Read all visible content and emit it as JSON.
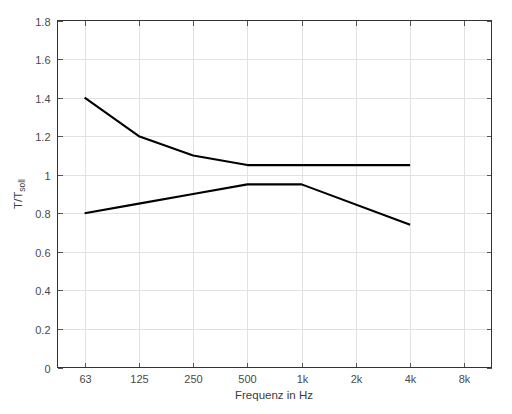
{
  "chart_data": {
    "type": "line",
    "title": "",
    "xlabel": "Frequenz in Hz",
    "ylabel": "T/T_soll",
    "ylabel_main": "T/T",
    "ylabel_subscript": "soll",
    "categories": [
      "63",
      "125",
      "250",
      "500",
      "1k",
      "2k",
      "4k",
      "8k"
    ],
    "xtick_labels": [
      "63",
      "125",
      "250",
      "500",
      "1k",
      "2k",
      "4k",
      "8k"
    ],
    "ytick_labels": [
      "0",
      "0.2",
      "0.4",
      "0.6",
      "0.8",
      "1",
      "1.2",
      "1.4",
      "1.6",
      "1.8"
    ],
    "ytick_values": [
      0,
      0.2,
      0.4,
      0.6,
      0.8,
      1.0,
      1.2,
      1.4,
      1.6,
      1.8
    ],
    "ylim": [
      0,
      1.8
    ],
    "xlim": [
      "63",
      "8k"
    ],
    "grid": true,
    "legend": null,
    "series": [
      {
        "name": "upper-tolerance",
        "color": "#000000",
        "x": [
          "63",
          "125",
          "250",
          "500",
          "1k",
          "4k"
        ],
        "values": [
          1.4,
          1.2,
          1.1,
          1.05,
          1.05,
          1.05
        ]
      },
      {
        "name": "lower-tolerance",
        "color": "#000000",
        "x": [
          "63",
          "125",
          "250",
          "500",
          "1k",
          "4k"
        ],
        "values": [
          0.8,
          0.85,
          0.9,
          0.95,
          0.95,
          0.74
        ]
      }
    ]
  },
  "style": {
    "background": "#ffffff",
    "grid_color": "#e2e2e2",
    "axis_color": "#333333",
    "tick_text_color": "#4a4a4a",
    "line_color": "#000000"
  }
}
